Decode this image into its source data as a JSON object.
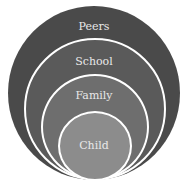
{
  "diagram": {
    "type": "nested-circles",
    "layers": [
      {
        "label": "Peers",
        "color": "#4a4a4a"
      },
      {
        "label": "School",
        "color": "#5a5a5a"
      },
      {
        "label": "Family",
        "color": "#6e6e6e"
      },
      {
        "label": "Child",
        "color": "#8c8c8c"
      }
    ],
    "ring_border_color": "#ffffff"
  }
}
